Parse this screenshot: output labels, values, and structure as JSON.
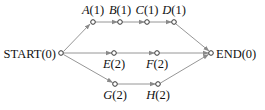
{
  "diagram": {
    "type": "directed-graph",
    "nodes": [
      {
        "id": "START",
        "name": "START",
        "weight": "0",
        "label": "START(0)",
        "x": 61,
        "y": 53,
        "label_pos": "left"
      },
      {
        "id": "A",
        "name": "A",
        "weight": "1",
        "label": "A(1)",
        "x": 93,
        "y": 22,
        "label_pos": "above"
      },
      {
        "id": "B",
        "name": "B",
        "weight": "1",
        "label": "B(1)",
        "x": 120,
        "y": 22,
        "label_pos": "above"
      },
      {
        "id": "C",
        "name": "C",
        "weight": "1",
        "label": "C(1)",
        "x": 147,
        "y": 22,
        "label_pos": "above"
      },
      {
        "id": "D",
        "name": "D",
        "weight": "1",
        "label": "D(1)",
        "x": 174,
        "y": 22,
        "label_pos": "above"
      },
      {
        "id": "E",
        "name": "E",
        "weight": "2",
        "label": "E(2)",
        "x": 114,
        "y": 53,
        "label_pos": "below"
      },
      {
        "id": "F",
        "name": "F",
        "weight": "2",
        "label": "F(2)",
        "x": 157,
        "y": 53,
        "label_pos": "below"
      },
      {
        "id": "G",
        "name": "G",
        "weight": "2",
        "label": "G(2)",
        "x": 115,
        "y": 84,
        "label_pos": "below"
      },
      {
        "id": "H",
        "name": "H",
        "weight": "2",
        "label": "H(2)",
        "x": 158,
        "y": 84,
        "label_pos": "below"
      },
      {
        "id": "END",
        "name": "END",
        "weight": "0",
        "label": "END(0)",
        "x": 211,
        "y": 53,
        "label_pos": "right"
      }
    ],
    "edges": [
      {
        "from": "START",
        "to": "A"
      },
      {
        "from": "A",
        "to": "B"
      },
      {
        "from": "B",
        "to": "C"
      },
      {
        "from": "C",
        "to": "D"
      },
      {
        "from": "D",
        "to": "END"
      },
      {
        "from": "START",
        "to": "E"
      },
      {
        "from": "E",
        "to": "F"
      },
      {
        "from": "F",
        "to": "END"
      },
      {
        "from": "START",
        "to": "G"
      },
      {
        "from": "G",
        "to": "H"
      },
      {
        "from": "H",
        "to": "END"
      }
    ],
    "colors": {
      "edge": "#8a8a8a",
      "node_stroke": "#333333",
      "text": "#111111"
    }
  },
  "labels": {
    "start": "START(0)",
    "end": "END(0)",
    "a_name": "A",
    "a_w": "(1)",
    "b_name": "B",
    "b_w": "(1)",
    "c_name": "C",
    "c_w": "(1)",
    "d_name": "D",
    "d_w": "(1)",
    "e_name": "E",
    "e_w": "(2)",
    "f_name": "F",
    "f_w": "(2)",
    "g_name": "G",
    "g_w": "(2)",
    "h_name": "H",
    "h_w": "(2)"
  }
}
